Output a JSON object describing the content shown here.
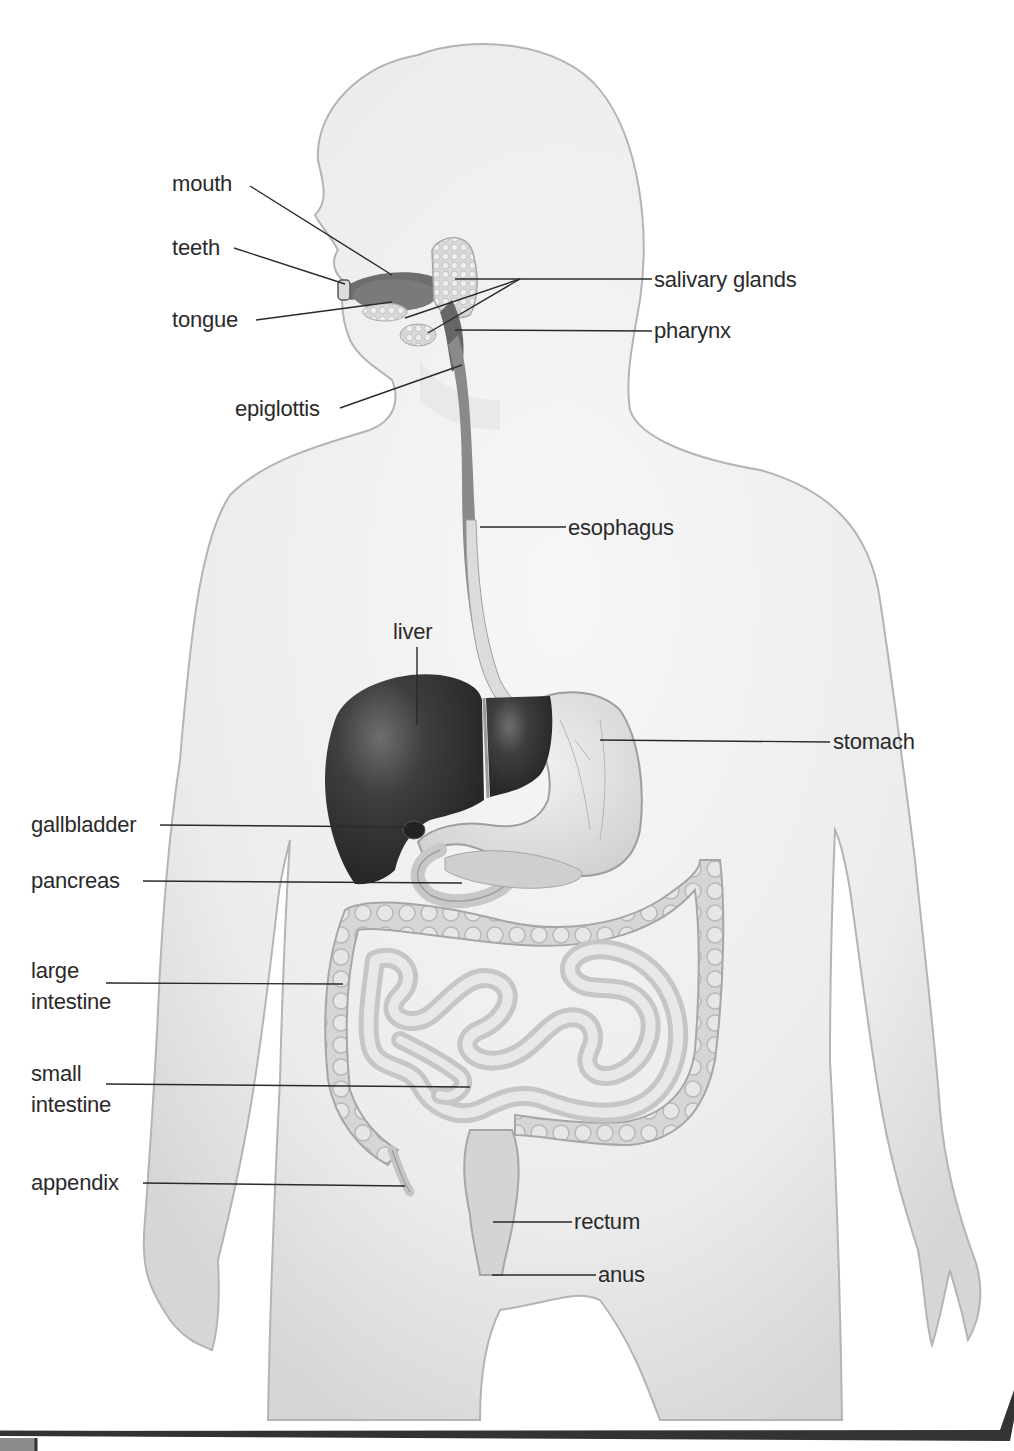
{
  "diagram": {
    "labels": {
      "mouth": "mouth",
      "teeth": "teeth",
      "tongue": "tongue",
      "epiglottis": "epiglottis",
      "salivary_glands": "salivary glands",
      "pharynx": "pharynx",
      "esophagus": "esophagus",
      "liver": "liver",
      "stomach": "stomach",
      "gallbladder": "gallbladder",
      "pancreas": "pancreas",
      "large_intestine": "large\nintestine",
      "small_intestine": "small\nintestine",
      "appendix": "appendix",
      "rectum": "rectum",
      "anus": "anus"
    },
    "colors": {
      "body_fill": "#ececec",
      "body_outline": "#b4b4b4",
      "liver": "#3a3a3a",
      "esophagus": "#6a6a6a",
      "intestine": "#d2d2d2",
      "leader_line": "#2a2a2a",
      "frame_border": "#333333"
    }
  }
}
